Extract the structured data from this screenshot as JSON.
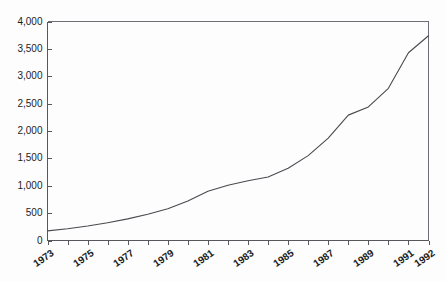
{
  "chart_data": {
    "type": "line",
    "title": "",
    "xlabel": "",
    "ylabel": "",
    "ylim": [
      0,
      4000
    ],
    "xlim": [
      1973,
      1992
    ],
    "grid": false,
    "legend": null,
    "y_ticks": [
      "0",
      "500",
      "1,000",
      "1,500",
      "2,000",
      "2,500",
      "3,000",
      "3,500",
      "4,000"
    ],
    "y_tick_values": [
      0,
      500,
      1000,
      1500,
      2000,
      2500,
      3000,
      3500,
      4000
    ],
    "x_tick_labels": [
      "1973",
      "1975",
      "1977",
      "1979",
      "1981",
      "1983",
      "1985",
      "1987",
      "1989",
      "1991",
      "1992"
    ],
    "x_tick_label_values": [
      1973,
      1975,
      1977,
      1979,
      1981,
      1983,
      1985,
      1987,
      1989,
      1991,
      1992
    ],
    "x_minor_ticks": [
      1973,
      1974,
      1975,
      1976,
      1977,
      1978,
      1979,
      1980,
      1981,
      1982,
      1983,
      1984,
      1985,
      1986,
      1987,
      1988,
      1989,
      1990,
      1991,
      1992
    ],
    "x": [
      1973,
      1974,
      1975,
      1976,
      1977,
      1978,
      1979,
      1980,
      1981,
      1982,
      1983,
      1984,
      1985,
      1986,
      1987,
      1988,
      1989,
      1990,
      1991,
      1992
    ],
    "values": [
      175,
      215,
      265,
      325,
      395,
      480,
      580,
      720,
      900,
      1010,
      1090,
      1160,
      1320,
      1550,
      1870,
      2290,
      2440,
      2780,
      3430,
      3740
    ],
    "series": [
      {
        "name": "series-1",
        "color": "#4a4a50",
        "values": [
          175,
          215,
          265,
          325,
          395,
          480,
          580,
          720,
          900,
          1010,
          1090,
          1160,
          1320,
          1550,
          1870,
          2290,
          2440,
          2780,
          3430,
          3740
        ]
      }
    ]
  },
  "colors": {
    "line": "#4a4a50",
    "axis": "#58585c",
    "frame": "#6e6e74",
    "background": "#fdfdfd",
    "text": "#1c1c1c"
  }
}
